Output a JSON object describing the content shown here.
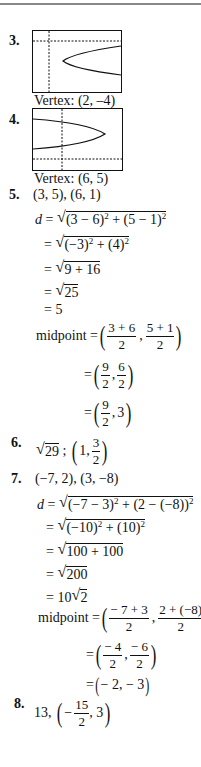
{
  "problems": [
    {
      "number": "3.",
      "graph": "parabola-opens-right-lower",
      "caption": "Vertex: (2, –4)"
    },
    {
      "number": "4.",
      "graph": "parabola-opens-right-upper",
      "caption": "Vertex: (6, 5)"
    },
    {
      "number": "5.",
      "points": "(3, 5), (6, 1)",
      "distance_lines": [
        {
          "prefix": "d = ",
          "radicand": [
            "(3 − 6)",
            "2",
            " + (5 − 1)",
            "2"
          ]
        },
        {
          "prefix": "= ",
          "radicand": [
            "(−3)",
            "2",
            " + (4)",
            "2"
          ]
        },
        {
          "prefix": "= ",
          "radicand_text": "9 + 16"
        },
        {
          "prefix": "= ",
          "radicand_text": "25"
        },
        {
          "prefix": "= ",
          "value": "5"
        }
      ],
      "midpoint_label": "midpoint = ",
      "midpoint_lines": [
        {
          "a_num": "3 + 6",
          "a_den": "2",
          "b_num": "5 + 1",
          "b_den": "2"
        },
        {
          "a_num": "9",
          "a_den": "2",
          "b_num": "6",
          "b_den": "2"
        },
        {
          "a_num": "9",
          "a_den": "2",
          "b": "3"
        }
      ]
    },
    {
      "number": "6.",
      "radicand": "29",
      "sep": " ; ",
      "mid_a": "1,",
      "mid_b_num": "3",
      "mid_b_den": "2"
    },
    {
      "number": "7.",
      "points": "(−7, 2), (3, −8)",
      "distance_lines": [
        {
          "prefix": "d = ",
          "radicand": [
            "(−7 − 3)",
            "2",
            " + (2 − (−8))",
            "2"
          ]
        },
        {
          "prefix": "= ",
          "radicand": [
            "(−10)",
            "2",
            " + (10)",
            "2"
          ]
        },
        {
          "prefix": "= ",
          "radicand_text": "100 + 100"
        },
        {
          "prefix": "= ",
          "radicand_text": "200"
        },
        {
          "prefix": "= 10",
          "radicand_text": "2"
        }
      ],
      "midpoint_label": "midpoint = ",
      "midpoint_lines": [
        {
          "a_num": "− 7 + 3",
          "a_den": "2",
          "b_num": "2 + (−8)",
          "b_den": "2"
        },
        {
          "a_num": "− 4",
          "a_den": "2",
          "b_num": "− 6",
          "b_den": "2"
        },
        {
          "text": "− 2, − 3"
        }
      ]
    },
    {
      "number": "8.",
      "prefix": "13, ",
      "mid_a_sign": "−",
      "mid_a_num": "15",
      "mid_a_den": "2",
      "mid_b": ", 3"
    }
  ]
}
